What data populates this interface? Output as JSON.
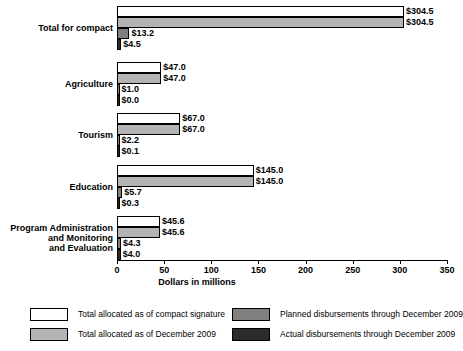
{
  "chart_data": {
    "type": "bar",
    "orientation": "horizontal",
    "title": "",
    "xlabel": "Dollars in millions",
    "ylabel": "",
    "xlim": [
      0,
      350
    ],
    "xticks": [
      0,
      50,
      100,
      150,
      200,
      250,
      300,
      350
    ],
    "xtick_labels": [
      "0",
      "50",
      "100",
      "150",
      "200",
      "250",
      "300",
      "350"
    ],
    "grid": false,
    "legend_position": "bottom",
    "categories": [
      "Total for compact",
      "Agriculture",
      "Tourism",
      "Education",
      "Program Administration and Monitoring and Evaluation"
    ],
    "series": [
      {
        "name": "Total allocated as of compact signature",
        "color": "#ffffff",
        "values": [
          304.5,
          47.0,
          67.0,
          145.0,
          45.6
        ],
        "labels": [
          "$304.5",
          "$47.0",
          "$67.0",
          "$145.0",
          "$45.6"
        ]
      },
      {
        "name": "Total allocated as of December 2009",
        "color": "#b4b4b4",
        "values": [
          304.5,
          47.0,
          67.0,
          145.0,
          45.6
        ],
        "labels": [
          "$304.5",
          "$47.0",
          "$67.0",
          "$145.0",
          "$45.6"
        ]
      },
      {
        "name": "Planned disbursements through December 2009",
        "color": "#808080",
        "values": [
          13.2,
          1.0,
          2.2,
          5.7,
          4.3
        ],
        "labels": [
          "$13.2",
          "$1.0",
          "$2.2",
          "$5.7",
          "$4.3"
        ]
      },
      {
        "name": "Actual disbursements through December 2009",
        "color": "#2b2b2b",
        "values": [
          4.5,
          0.0,
          0.1,
          0.3,
          4.0
        ],
        "labels": [
          "$4.5",
          "$0.0",
          "$0.1",
          "$0.3",
          "$4.0"
        ]
      }
    ]
  },
  "category_label_lines": [
    [
      "Total for compact"
    ],
    [
      "Agriculture"
    ],
    [
      "Tourism"
    ],
    [
      "Education"
    ],
    [
      "Program Administration",
      "and Monitoring",
      "and Evaluation"
    ]
  ],
  "legend": [
    {
      "label": "Total allocated as of compact signature",
      "swatch": "s0"
    },
    {
      "label": "Total allocated as of December 2009",
      "swatch": "s1"
    },
    {
      "label": "Planned disbursements through December 2009",
      "swatch": "s2"
    },
    {
      "label": "Actual disbursements through December 2009",
      "swatch": "s3"
    }
  ]
}
